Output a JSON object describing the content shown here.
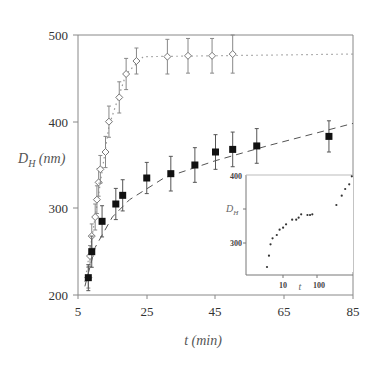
{
  "chart_data": {
    "type": "scatter",
    "title": "",
    "xlabel": "t (min)",
    "ylabel": "D_H (nm)",
    "xlim": [
      5,
      85
    ],
    "ylim": [
      200,
      500
    ],
    "x_ticks": [
      5,
      25,
      45,
      65,
      85
    ],
    "y_ticks": [
      200,
      300,
      400,
      500
    ],
    "grid": false,
    "legend": null,
    "series": [
      {
        "name": "open-diamond",
        "marker": "open diamond",
        "line": "dotted",
        "x": [
          8,
          8.5,
          9,
          10,
          10.5,
          11,
          11.5,
          13,
          14,
          17,
          19,
          22,
          31,
          37,
          44,
          50
        ],
        "y": [
          220,
          245,
          268,
          290,
          310,
          330,
          345,
          365,
          400,
          428,
          455,
          470,
          475,
          476,
          476,
          478
        ],
        "error": [
          12,
          12,
          14,
          15,
          16,
          16,
          16,
          18,
          18,
          18,
          18,
          15,
          20,
          20,
          20,
          22
        ],
        "fit_line": {
          "x": [
            7,
            10,
            14,
            19,
            24,
            85
          ],
          "y": [
            215,
            290,
            395,
            455,
            475,
            478
          ]
        }
      },
      {
        "name": "filled-square",
        "marker": "filled square",
        "line": "dashed",
        "x": [
          8,
          9,
          12,
          16,
          18,
          25,
          32,
          39,
          45,
          50,
          57,
          78
        ],
        "y": [
          220,
          250,
          285,
          305,
          315,
          335,
          340,
          350,
          365,
          368,
          372,
          383
        ],
        "error": [
          15,
          18,
          18,
          18,
          18,
          18,
          20,
          20,
          20,
          20,
          20,
          18
        ],
        "fit_line": {
          "x": [
            7,
            10,
            15,
            20,
            30,
            45,
            60,
            85
          ],
          "y": [
            210,
            255,
            290,
            310,
            335,
            355,
            372,
            398
          ]
        }
      }
    ],
    "inset": {
      "type": "scatter",
      "xscale": "log",
      "xlabel": "t",
      "ylabel": "D_H",
      "y_ticks": [
        300,
        400
      ],
      "x_ticks": [
        10,
        100
      ],
      "ylim": [
        250,
        400
      ],
      "points": [
        {
          "x": 7,
          "y": 262
        },
        {
          "x": 7.8,
          "y": 279
        },
        {
          "x": 8.5,
          "y": 296
        },
        {
          "x": 9.5,
          "y": 305
        },
        {
          "x": 12,
          "y": 310
        },
        {
          "x": 14,
          "y": 318
        },
        {
          "x": 17,
          "y": 321
        },
        {
          "x": 20,
          "y": 326
        },
        {
          "x": 28,
          "y": 333
        },
        {
          "x": 35,
          "y": 333
        },
        {
          "x": 40,
          "y": 336
        },
        {
          "x": 46,
          "y": 341
        },
        {
          "x": 65,
          "y": 340
        },
        {
          "x": 75,
          "y": 340
        },
        {
          "x": 85,
          "y": 341
        },
        {
          "x": 320,
          "y": 355
        },
        {
          "x": 430,
          "y": 369
        },
        {
          "x": 520,
          "y": 379
        },
        {
          "x": 650,
          "y": 386
        },
        {
          "x": 750,
          "y": 398
        }
      ]
    }
  },
  "labels": {
    "x_title": "t (min)",
    "y_title_main": "D",
    "y_title_sub": "H",
    "y_title_unit": " (nm)",
    "inset_y_title_main": "D",
    "inset_y_title_sub": "H",
    "inset_x_title": "t",
    "inset_y_ticks": [
      "400",
      "300"
    ],
    "inset_x_ticks": [
      "10",
      "100"
    ],
    "x_ticks": [
      "5",
      "25",
      "45",
      "65",
      "85"
    ],
    "y_ticks": [
      "500",
      "400",
      "300",
      "200"
    ]
  }
}
